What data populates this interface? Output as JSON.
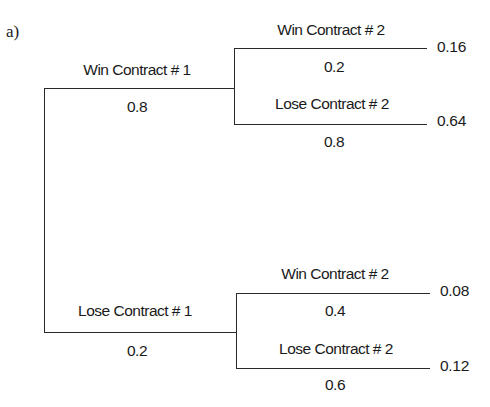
{
  "diagram": {
    "part_label": "a)",
    "type": "probability-tree",
    "root": {
      "branches": [
        {
          "label": "Win Contract # 1",
          "probability": "0.8",
          "children": [
            {
              "label": "Win Contract # 2",
              "probability": "0.2",
              "joint": "0.16"
            },
            {
              "label": "Lose Contract # 2",
              "probability": "0.8",
              "joint": "0.64"
            }
          ]
        },
        {
          "label": "Lose Contract # 1",
          "probability": "0.2",
          "children": [
            {
              "label": "Win Contract # 2",
              "probability": "0.4",
              "joint": "0.08"
            },
            {
              "label": "Lose Contract # 2",
              "probability": "0.6",
              "joint": "0.12"
            }
          ]
        }
      ]
    }
  }
}
